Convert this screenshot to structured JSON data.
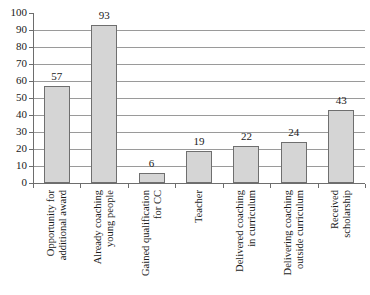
{
  "chart_data": {
    "type": "bar",
    "title": "",
    "subtitle": "",
    "xlabel": "",
    "ylabel": "",
    "ylim": [
      0,
      100
    ],
    "ytick_step": 10,
    "yticks": [
      "0",
      "10",
      "20",
      "30",
      "40",
      "50",
      "60",
      "70",
      "80",
      "90",
      "100"
    ],
    "grid": "horizontal",
    "legend": "none",
    "orientation": "vertical",
    "categories": [
      "Opportunity for additional award",
      "Already coaching young people",
      "Gained qualification for CC",
      "Teacher",
      "Delivered coaching in curriculum",
      "Delivering coaching outside curriculum",
      "Received scholarship"
    ],
    "category_lines": [
      [
        "Opportunity for",
        "additional award"
      ],
      [
        "Already coaching",
        "young people"
      ],
      [
        "Gained qualification",
        "for CC"
      ],
      [
        "Teacher",
        ""
      ],
      [
        "Delivered coaching",
        "in curriculum"
      ],
      [
        "Delivering coaching",
        "outside curriculum"
      ],
      [
        "Received",
        "scholarship"
      ]
    ],
    "values": [
      57,
      93,
      6,
      19,
      22,
      24,
      43
    ],
    "value_labels": [
      "57",
      "93",
      "6",
      "19",
      "22",
      "24",
      "43"
    ],
    "colors": {
      "bar_fill": "#d5d5d5",
      "bar_border": "#6f6f6f",
      "gridline": "#9a9a9a",
      "axis": "#6d6d6d",
      "text": "#1a1a1a",
      "background": "#ffffff"
    }
  }
}
